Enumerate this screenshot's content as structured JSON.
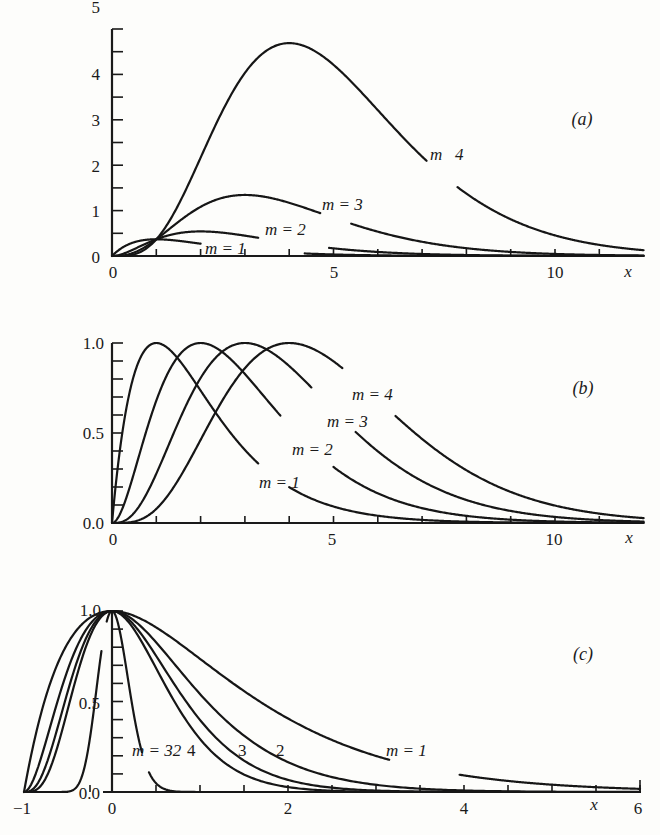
{
  "chart_data": [
    {
      "panel": "a",
      "type": "line",
      "title": "(a)",
      "xlabel": "x",
      "ylabel": "",
      "xlim": [
        0,
        12
      ],
      "ylim": [
        0,
        5
      ],
      "x_tick_labels": [
        "0",
        "5",
        "10"
      ],
      "y_tick_labels": [
        "0",
        "1",
        "2",
        "3",
        "4",
        "5"
      ],
      "grid": false,
      "function": "x^m * exp(-x)",
      "series": [
        {
          "name": "m=1",
          "label": "m = 1",
          "peak_x": 1,
          "peak_y": 0.37
        },
        {
          "name": "m=2",
          "label": "m = 2",
          "peak_x": 2,
          "peak_y": 0.54
        },
        {
          "name": "m=3",
          "label": "m = 3",
          "peak_x": 3,
          "peak_y": 1.34
        },
        {
          "name": "m=4",
          "label": "m   4",
          "peak_x": 4,
          "peak_y": 4.69
        }
      ]
    },
    {
      "panel": "b",
      "type": "line",
      "title": "(b)",
      "xlabel": "x",
      "xlim": [
        0,
        12
      ],
      "ylim": [
        0,
        1.0
      ],
      "x_tick_labels": [
        "0",
        "5",
        "10"
      ],
      "y_tick_labels": [
        "0.0",
        "0.5",
        "1.0"
      ],
      "grid": false,
      "function": "(x/m)^m * exp(m - x)",
      "series": [
        {
          "name": "m=1",
          "label": "m = 1",
          "peak_x": 1,
          "peak_y": 1.0
        },
        {
          "name": "m=2",
          "label": "m = 2",
          "peak_x": 2,
          "peak_y": 1.0
        },
        {
          "name": "m=3",
          "label": "m = 3",
          "peak_x": 3,
          "peak_y": 1.0
        },
        {
          "name": "m=4",
          "label": "m = 4",
          "peak_x": 4,
          "peak_y": 1.0
        }
      ]
    },
    {
      "panel": "c",
      "type": "line",
      "title": "(c)",
      "xlabel": "x",
      "xlim": [
        -1,
        6
      ],
      "ylim": [
        0,
        1.0
      ],
      "x_tick_labels": [
        "-1",
        "0",
        "2",
        "4",
        "6"
      ],
      "y_tick_labels": [
        "0.0",
        "0.5",
        "1.0"
      ],
      "grid": false,
      "function": "(1+x)^m * exp(-m x)",
      "series": [
        {
          "name": "m=1",
          "label": "m = 1",
          "peak_x": 0,
          "peak_y": 1.0
        },
        {
          "name": "m=2",
          "label": "2",
          "peak_x": 0,
          "peak_y": 1.0
        },
        {
          "name": "m=3",
          "label": "3",
          "peak_x": 0,
          "peak_y": 1.0
        },
        {
          "name": "m=4",
          "label": "4",
          "peak_x": 0,
          "peak_y": 1.0
        },
        {
          "name": "m=32",
          "label": "m = 32",
          "peak_x": 0,
          "peak_y": 1.0
        }
      ]
    }
  ],
  "labels": {
    "a": {
      "panel": "(a)",
      "x": "x",
      "m1": "m = 1",
      "m2": "m = 2",
      "m3": "m = 3",
      "m4": "m   4",
      "xt": [
        "0",
        "5",
        "10"
      ],
      "yt": [
        "0",
        "1",
        "2",
        "3",
        "4",
        "5"
      ]
    },
    "b": {
      "panel": "(b)",
      "x": "x",
      "m1": "m = 1",
      "m2": "m = 2",
      "m3": "m = 3",
      "m4": "m = 4",
      "xt": [
        "0",
        "5",
        "10"
      ],
      "yt": [
        "0.0",
        "0.5",
        "1.0"
      ]
    },
    "c": {
      "panel": "(c)",
      "x": "x",
      "m1": "m = 1",
      "m2": "2",
      "m3": "3",
      "m4": "4",
      "m32": "m = 32",
      "xt": [
        "−1",
        "0",
        "2",
        "4",
        "6"
      ],
      "yt": [
        "0.0",
        "0.5",
        "1.0"
      ]
    }
  }
}
